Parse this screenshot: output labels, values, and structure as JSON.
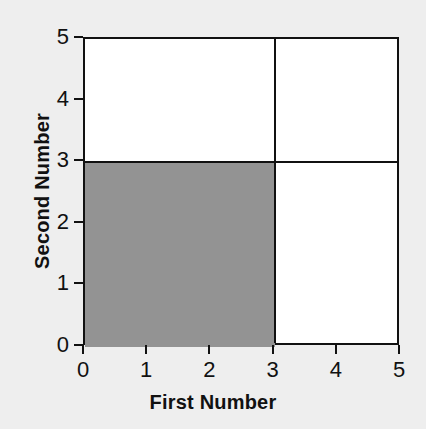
{
  "chart_data": {
    "type": "area",
    "title": "",
    "xlabel": "First Number",
    "ylabel": "Second Number",
    "xlim": [
      0,
      5
    ],
    "ylim": [
      0,
      5
    ],
    "xticks": [
      "0",
      "1",
      "2",
      "3",
      "4",
      "5"
    ],
    "yticks": [
      "0",
      "1",
      "2",
      "3",
      "4",
      "5"
    ],
    "xtick_values": [
      0,
      1,
      2,
      3,
      4,
      5
    ],
    "ytick_values": [
      0,
      1,
      2,
      3,
      4,
      5
    ],
    "grid": false,
    "legend": null,
    "background_color": "#eeeeee",
    "plot_background_color": "#ffffff",
    "line_color": "#111111",
    "shaded_color": "#939393",
    "dividers": {
      "vertical_x": 3,
      "horizontal_y": 3
    },
    "regions": [
      {
        "name": "shaded-lower-left",
        "x0": 0,
        "x1": 3,
        "y0": 0,
        "y1": 3,
        "fill": "#939393",
        "shaded": true
      },
      {
        "name": "upper-left",
        "x0": 0,
        "x1": 3,
        "y0": 3,
        "y1": 5,
        "fill": "#ffffff",
        "shaded": false
      },
      {
        "name": "upper-right",
        "x0": 3,
        "x1": 5,
        "y0": 3,
        "y1": 5,
        "fill": "#ffffff",
        "shaded": false
      },
      {
        "name": "lower-right",
        "x0": 3,
        "x1": 5,
        "y0": 0,
        "y1": 3,
        "fill": "#ffffff",
        "shaded": false
      }
    ]
  }
}
